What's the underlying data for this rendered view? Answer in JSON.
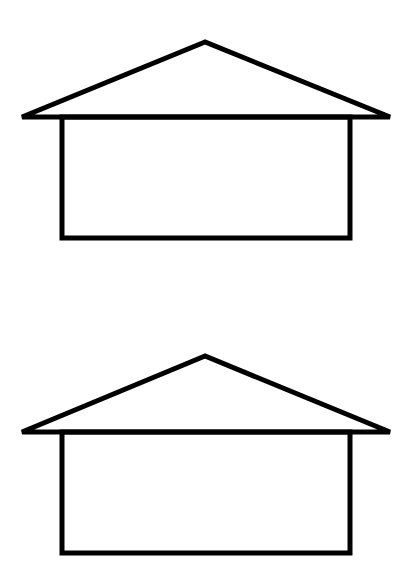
{
  "figure": {
    "stroke_color": "#000000",
    "background_color": "#ffffff",
    "houses": [
      {
        "label": "house-top",
        "roof": {
          "apex": [
            205,
            42
          ],
          "left": [
            22,
            117
          ],
          "right": [
            390,
            117
          ]
        },
        "body": {
          "x": 62,
          "y": 117,
          "width": 288,
          "height": 121
        }
      },
      {
        "label": "house-bottom",
        "roof": {
          "apex": [
            205,
            356
          ],
          "left": [
            22,
            432
          ],
          "right": [
            390,
            432
          ]
        },
        "body": {
          "x": 62,
          "y": 432,
          "width": 288,
          "height": 121
        }
      }
    ]
  }
}
